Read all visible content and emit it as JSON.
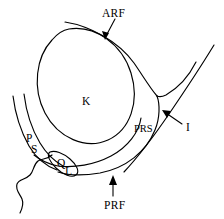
{
  "figure": {
    "type": "anatomical-line-diagram",
    "background_color": "#ffffff",
    "line_color": "#000000"
  },
  "labels": {
    "arf": {
      "text": "ARF",
      "meaning": "anterior renal fascia",
      "x": 102,
      "y": 8,
      "leader": "arrow-down-left"
    },
    "prs": {
      "text": "PRS",
      "meaning": "perirenal space",
      "x": 134,
      "y": 124,
      "leader": "none"
    },
    "prf": {
      "text": "PRF",
      "meaning": "posterior renal fascia",
      "x": 104,
      "y": 200,
      "leader": "arrow-up"
    },
    "i": {
      "text": "I",
      "meaning": "interfascial plane",
      "x": 186,
      "y": 122,
      "leader": "arrow-up-left"
    },
    "k": {
      "text": "K",
      "meaning": "kidney",
      "x": 82,
      "y": 96,
      "leader": "none"
    },
    "p": {
      "text": "P",
      "meaning": "posterior interfascial plane",
      "x": 26,
      "y": 133,
      "leader": "none"
    },
    "s": {
      "text": "S",
      "meaning": "lateroconal plane",
      "x": 31,
      "y": 144,
      "leader": "none"
    },
    "q": {
      "text": "Q",
      "meaning": "quadratus lumborum plane",
      "x": 57,
      "y": 158,
      "leader": "none"
    },
    "l": {
      "text": "L",
      "meaning": "lateroconal fascia",
      "x": 65,
      "y": 166,
      "leader": "none"
    }
  },
  "shapes": {
    "kidney_outline": "inner ellipse rotated, centered near (83,97)",
    "perirenal_outer": "large teardrop enclosing kidney, apex toward lower right",
    "anterior_renal_fascia": "arc sweeping from upper-left to right notch",
    "posterior_renal_fascia": "lower arc running beneath kidney to the left",
    "interfascial_line": "long diagonal from upper right to lower left",
    "lateroconal_wedge": "narrow left wedge containing P and S",
    "quadratus_loop": "small closed loop containing Q and L",
    "psoas_squiggle": "wavy line descending to lower left"
  }
}
